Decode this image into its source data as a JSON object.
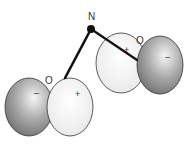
{
  "diagram": {
    "nitrogen_label": "N",
    "left_lobe": {
      "oxygen_label": "O",
      "negative_sign": "–",
      "positive_sign": "+"
    },
    "right_lobe": {
      "oxygen_label": "O",
      "negative_sign": "–",
      "positive_sign": "+"
    },
    "colors": {
      "dark_lobe": "#8a8a8a",
      "light_lobe": "#f2f2f2",
      "outline": "#333333",
      "bond": "#111111"
    }
  }
}
